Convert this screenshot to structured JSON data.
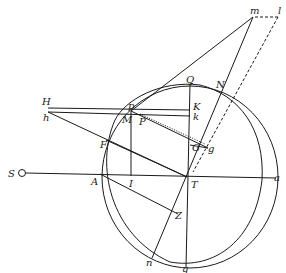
{
  "diagram": {
    "type": "geometric-construction",
    "colors": {
      "ink": "#1a1a1a",
      "background": "#ffffff"
    },
    "labels": {
      "S": "S",
      "A": "A",
      "I": "I",
      "T": "T",
      "a": "a",
      "H": "H",
      "h": "h",
      "p": "p",
      "M": "M",
      "P": "P",
      "Q": "Q",
      "K": "K",
      "k": "k",
      "N": "N",
      "G": "G",
      "g": "g",
      "F": "F",
      "Z": "Z",
      "n": "n",
      "q": "q",
      "m": "m",
      "l": "l"
    }
  }
}
